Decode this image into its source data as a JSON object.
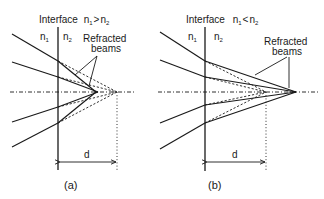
{
  "panels": [
    {
      "id": "a",
      "caption": "(a)",
      "title_prefix": "Interface",
      "relation": {
        "left": "n",
        "left_sub": "1",
        "op": ">",
        "right": "n",
        "right_sub": "2"
      },
      "medium_left": {
        "symbol": "n",
        "sub": "1"
      },
      "medium_right": {
        "symbol": "n",
        "sub": "2"
      },
      "callout_line1": "Refracted",
      "callout_line2": "beams",
      "distance_label": "d"
    },
    {
      "id": "b",
      "caption": "(b)",
      "title_prefix": "Interface",
      "relation": {
        "left": "n",
        "left_sub": "1",
        "op": "<",
        "right": "n",
        "right_sub": "2"
      },
      "medium_left": {
        "symbol": "n",
        "sub": "1"
      },
      "medium_right": {
        "symbol": "n",
        "sub": "2"
      },
      "callout_line1": "Refracted",
      "callout_line2": "beams",
      "distance_label": "d"
    }
  ]
}
